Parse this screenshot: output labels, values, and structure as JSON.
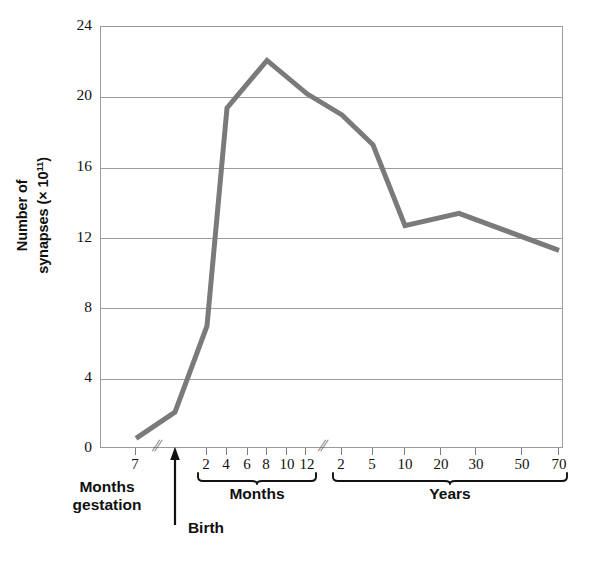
{
  "chart_data": {
    "type": "line",
    "title": "",
    "xlabel": "",
    "ylabel": "Number of synapses (× 10¹¹)",
    "ylim": [
      0,
      24
    ],
    "yticks": [
      0,
      4,
      8,
      12,
      16,
      20,
      24
    ],
    "grid": true,
    "legend": null,
    "x_is_categorical_broken_axis": true,
    "x_axis_segments": [
      {
        "name": "Months gestation",
        "label": "Months\ngestation",
        "label_line1": "Months",
        "label_line2": "gestation",
        "ticks": [
          "7"
        ]
      },
      {
        "name": "Birth",
        "label": "Birth",
        "ticks": []
      },
      {
        "name": "Months",
        "label": "Months",
        "ticks": [
          "2",
          "4",
          "6",
          "8",
          "10",
          "12"
        ]
      },
      {
        "name": "Years",
        "label": "Years",
        "ticks": [
          "2",
          "5",
          "10",
          "20",
          "30",
          "50",
          "70"
        ]
      }
    ],
    "axis_breaks": 2,
    "break_symbol": "//",
    "categories": [
      "7 months gestation",
      "Birth",
      "2 months",
      "4 months",
      "8 months",
      "12 months",
      "2 years",
      "5 years",
      "10 years",
      "25 years",
      "70 years"
    ],
    "values": [
      0.6,
      2.1,
      7.0,
      19.4,
      22.1,
      20.2,
      19.0,
      17.3,
      12.7,
      13.4,
      11.3
    ],
    "series": [
      {
        "name": "Number of synapses",
        "color": "#7a7a7a",
        "line_width": 5,
        "values": [
          0.6,
          2.1,
          7.0,
          19.4,
          22.1,
          20.2,
          19.0,
          17.3,
          12.7,
          13.4,
          11.3
        ]
      }
    ],
    "colors": {
      "line": "#7a7a7a",
      "grid": "#9d9d9d",
      "frame": "#9a9a9a",
      "text": "#111111"
    }
  },
  "axis": {
    "y_title_main": "Number of",
    "y_title_sub": "synapses (× 10",
    "y_title_exp": "11",
    "y_title_close": ")",
    "y_ticks": [
      "24",
      "20",
      "16",
      "12",
      "8",
      "4",
      "0"
    ]
  },
  "x_ticks": {
    "gestation": [
      "7"
    ],
    "months": [
      "2",
      "4",
      "6",
      "8",
      "10",
      "12"
    ],
    "years": [
      "2",
      "5",
      "10",
      "20",
      "30",
      "50",
      "70"
    ]
  },
  "labels": {
    "months_gestation_line1": "Months",
    "months_gestation_line2": "gestation",
    "birth": "Birth",
    "months": "Months",
    "years": "Years",
    "break_symbol": "//"
  }
}
